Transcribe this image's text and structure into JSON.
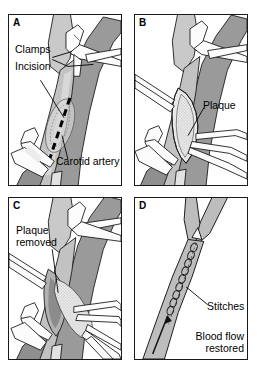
{
  "figure": {
    "background_color": "#ffffff",
    "line_color": "#1a1a1a",
    "vessel_fill": "#b8b8b8",
    "vessel_fill_light": "#d2d2d2",
    "vessel_shadow": "#8f8f8f",
    "plaque_fill": "#e8e8e8",
    "instrument_fill": "#fbfbfb"
  },
  "panels": [
    {
      "id": "A",
      "letter": "A",
      "labels": [
        {
          "name": "clamps",
          "text": "Clamps"
        },
        {
          "name": "incision",
          "text": "Incision"
        },
        {
          "name": "carotid-artery",
          "text": "Carotid artery"
        }
      ],
      "elements": [
        "carotid-bifurcation",
        "two-vascular-clamps",
        "dashed-incision-line"
      ]
    },
    {
      "id": "B",
      "letter": "B",
      "labels": [
        {
          "name": "plaque",
          "text": "Plaque"
        }
      ],
      "elements": [
        "opened-artery",
        "exposed-plaque",
        "retractors",
        "clamps"
      ]
    },
    {
      "id": "C",
      "letter": "C",
      "labels": [
        {
          "name": "plaque-removed",
          "text": "Plaque\nremoved"
        }
      ],
      "elements": [
        "forceps",
        "plaque-being-extracted",
        "opened-artery",
        "clamps"
      ]
    },
    {
      "id": "D",
      "letter": "D",
      "labels": [
        {
          "name": "stitches",
          "text": "Stitches"
        },
        {
          "name": "blood-flow-restored",
          "text": "Blood flow\nrestored"
        }
      ],
      "elements": [
        "sutured-artery",
        "stitch-chain",
        "blood-flow-arrow"
      ]
    }
  ]
}
